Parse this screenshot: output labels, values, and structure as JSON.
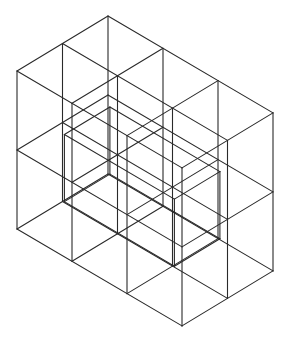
{
  "diagram": {
    "title": "Isometric wireframe of 3x2x2 cube grid with inner hollow block",
    "stroke_color": "#2a2a2a",
    "background": "#ffffff",
    "grid": {
      "width_units": 3,
      "depth_units": 2,
      "height_units": 2
    },
    "origin": {
      "x": 108,
      "y": 16
    },
    "unit_right": {
      "x": 55,
      "y": 32.3
    },
    "unit_left": {
      "x": -45.5,
      "y": 27.5
    },
    "unit_down": {
      "x": 0,
      "y": 79
    }
  }
}
